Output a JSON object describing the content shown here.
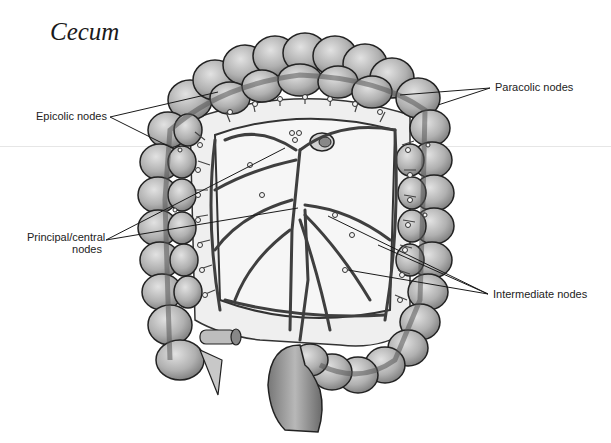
{
  "figure": {
    "title": "Cecum",
    "labels": [
      {
        "id": "paracolic",
        "text": "Paracolic nodes"
      },
      {
        "id": "epicolic",
        "text": "Epicolic nodes"
      },
      {
        "id": "principal_central_line1",
        "text": "Principal/central"
      },
      {
        "id": "principal_central_line2",
        "text": "nodes"
      },
      {
        "id": "intermediate",
        "text": "Intermediate nodes"
      }
    ],
    "colors": {
      "background": "#ffffff",
      "colon_fill": "#b5b5b5",
      "colon_highlight": "#d9d9d9",
      "outline": "#222222",
      "mesentery": "#eeeeee",
      "vessel": "#4a4a4a",
      "leader_line": "#1a1a1a"
    }
  }
}
